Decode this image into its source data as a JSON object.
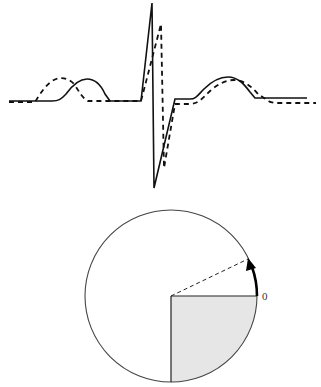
{
  "figure": {
    "waveform": {
      "series": [
        {
          "name": "solid-trace",
          "style": "solid",
          "color": "#111111"
        },
        {
          "name": "dashed-trace",
          "style": "dashed",
          "color": "#111111"
        }
      ]
    },
    "circle": {
      "shaded_quadrant_color": "#e6e6e6",
      "outline_color": "#444444",
      "zero_label": "0",
      "arrow_direction": "counter-clockwise"
    }
  }
}
